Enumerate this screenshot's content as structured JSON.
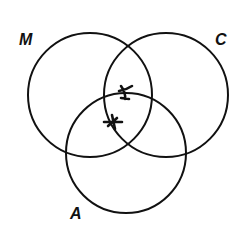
{
  "diagram": {
    "type": "venn",
    "sets": [
      {
        "id": "M",
        "label": "M"
      },
      {
        "id": "C",
        "label": "C"
      },
      {
        "id": "A",
        "label": "A"
      }
    ],
    "marks": [
      {
        "symbol": "cross",
        "region": "M∩C∩A (upper)"
      },
      {
        "symbol": "asterisk",
        "region": "M∩C∩A (lower)"
      }
    ],
    "colors": {
      "stroke": "#111111",
      "background": "#ffffff"
    }
  }
}
